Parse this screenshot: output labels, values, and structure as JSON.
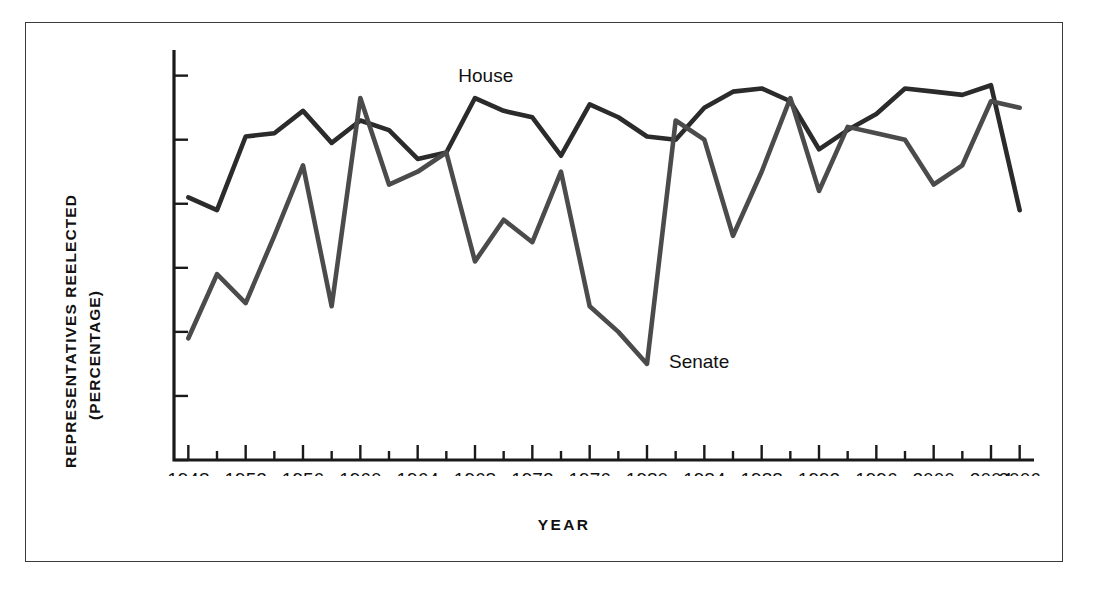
{
  "figure": {
    "background": "#ffffff",
    "frame_color": "#3a3a3a"
  },
  "axes": {
    "y_title_line1": "REPRESENTATIVES REELECTED",
    "y_title_line2": "(PERCENTAGE)",
    "x_title": "YEAR",
    "y_ticks": [
      40,
      50,
      60,
      70,
      80,
      90,
      100
    ],
    "x_ticks": [
      1948,
      1952,
      1956,
      1960,
      1964,
      1968,
      1972,
      1976,
      1980,
      1984,
      1988,
      1992,
      1996,
      2000,
      2004,
      2006
    ],
    "x_minor_step": 2
  },
  "labels": {
    "house": "House",
    "senate": "Senate"
  },
  "chart_data": {
    "type": "line",
    "title": "",
    "xlabel": "YEAR",
    "ylabel": "REPRESENTATIVES REELECTED (PERCENTAGE)",
    "xlim": [
      1947,
      2007
    ],
    "ylim": [
      40,
      104
    ],
    "grid": false,
    "legend": "inline-annotations",
    "x": [
      1948,
      1950,
      1952,
      1954,
      1956,
      1958,
      1960,
      1962,
      1964,
      1966,
      1968,
      1970,
      1972,
      1974,
      1976,
      1978,
      1980,
      1982,
      1984,
      1986,
      1988,
      1990,
      1992,
      1994,
      1996,
      1998,
      2000,
      2002,
      2004,
      2006
    ],
    "series": [
      {
        "name": "House",
        "color": "#2b2b2b",
        "values": [
          81,
          79,
          90.5,
          91,
          94.5,
          89.5,
          93,
          91.5,
          87,
          88,
          96.5,
          94.5,
          93.5,
          87.5,
          95.5,
          93.5,
          90.5,
          90,
          95,
          97.5,
          98,
          96,
          88.5,
          91.5,
          94,
          98,
          97.5,
          97,
          98.5,
          79
        ]
      },
      {
        "name": "Senate",
        "color": "#4b4b4b",
        "values": [
          59,
          69,
          64.5,
          75,
          86,
          64,
          96.5,
          83,
          85,
          88,
          71,
          77.5,
          74,
          85,
          64,
          60,
          55,
          93,
          90,
          75,
          85,
          96.5,
          82,
          92,
          91,
          90,
          83,
          86,
          96,
          95
        ]
      }
    ]
  }
}
